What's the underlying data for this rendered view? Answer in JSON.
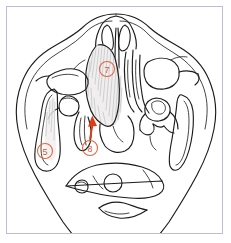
{
  "figure": {
    "caption": "",
    "background_color": "#ffffff",
    "frame_color": "#b9c0d6",
    "ink_color": "#1c1c1c",
    "annotation_color": "#d6562f",
    "arrow_color": "#e03b17"
  },
  "annotations": {
    "markers": [
      {
        "id": "marker-7",
        "label": "7",
        "shape": "circled-number",
        "cx": 107,
        "cy": 69,
        "r": 7.5,
        "color": "#d6562f"
      },
      {
        "id": "marker-5",
        "label": "5",
        "shape": "circled-number",
        "cx": 45,
        "cy": 151,
        "r": 7.5,
        "color": "#d6562f"
      },
      {
        "id": "marker-8",
        "label": "8",
        "shape": "circled-number",
        "cx": 90,
        "cy": 148,
        "r": 7.5,
        "color": "#d6562f"
      }
    ],
    "arrows": [
      {
        "id": "arrow-to-8",
        "from_x": 90,
        "from_y": 139,
        "to_x": 92,
        "to_y": 118,
        "color": "#e03b17",
        "points_to": "marker-8"
      }
    ]
  },
  "structures": {
    "outline_label": "head-outline",
    "regions": [
      "nasal-cavity",
      "nasal-septum",
      "maxillary-sinus-left",
      "maxillary-sinus-right",
      "sphenoid-sinus",
      "temporal-bone-left",
      "temporal-bone-right",
      "mandibular-condyle-left",
      "mandibular-condyle-right",
      "occipital-bone",
      "cervical-vertebra",
      "posterior-soft-tissue"
    ]
  }
}
